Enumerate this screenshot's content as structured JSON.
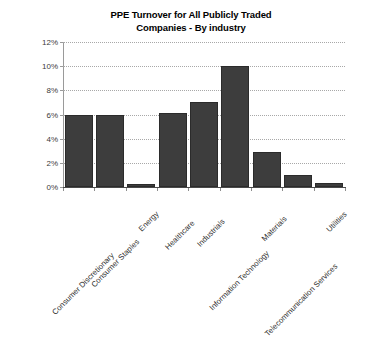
{
  "chart_data": {
    "type": "bar",
    "title": "PPE Turnover for All Publicly Traded Companies - By industry",
    "title_line1": "PPE Turnover for All Publicly Traded",
    "title_line2": "Companies - By industry",
    "xlabel": "",
    "ylabel": "",
    "categories": [
      "Consumer Discretionary",
      "Consumer Staples",
      "Energy",
      "Healthcare",
      "Industrials",
      "Information Technology",
      "Materials",
      "Telecommunication Services",
      "Utilities"
    ],
    "values": [
      5.95,
      5.98,
      0.25,
      6.1,
      7.05,
      10.05,
      2.9,
      1.0,
      0.35
    ],
    "value_labels": [
      "5.95%",
      "5.98%",
      "0.25%",
      "6.1%",
      "7.05%",
      "10.05%",
      "2.9%",
      "1.0%",
      "0.35%"
    ],
    "ylim": [
      0,
      12
    ],
    "yticks": [
      0,
      2,
      4,
      6,
      8,
      10,
      12
    ],
    "ytick_labels": [
      "0%",
      "2%",
      "4%",
      "6%",
      "8%",
      "10%",
      "12%"
    ],
    "grid": true,
    "grid_axis": "y",
    "legend": false,
    "legend_position": "none",
    "bar_color": "#3d3d3d",
    "grid_color": "#a8a8a8",
    "axis_color": "#8c8c8c",
    "text_color": "#2e2e2e",
    "background_color": "#ffffff"
  }
}
